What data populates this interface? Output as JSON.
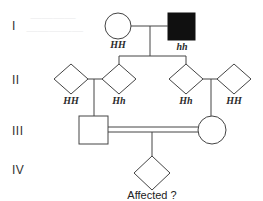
{
  "figure": {
    "type": "pedigree-chart",
    "caption": "Affected ?",
    "generations": [
      "I",
      "II",
      "III",
      "IV"
    ]
  },
  "colors": {
    "stroke": "#444444",
    "affected_fill": "#101010",
    "unaffected_fill": "#ffffff",
    "text": "#222222",
    "ghost": "#e8e8ea"
  },
  "legend": {
    "affected_meaning": "filled symbol = affected",
    "unaffected_meaning": "open symbol = unaffected",
    "diamond_meaning": "diamond = sex unspecified",
    "double_line_meaning": "double line = consanguineous mating"
  },
  "generation_I": {
    "label": "I",
    "individuals": [
      {
        "id": "I-1",
        "shape": "circle",
        "sex": "female",
        "affected": false,
        "genotype": "HH"
      },
      {
        "id": "I-2",
        "shape": "square",
        "sex": "male",
        "affected": true,
        "genotype": "hh"
      }
    ]
  },
  "generation_II": {
    "label": "II",
    "individuals": [
      {
        "id": "II-1",
        "shape": "diamond",
        "sex": "unspecified",
        "affected": false,
        "genotype": "HH",
        "role": "spouse"
      },
      {
        "id": "II-2",
        "shape": "diamond",
        "sex": "unspecified",
        "affected": false,
        "genotype": "Hh",
        "role": "child"
      },
      {
        "id": "II-3",
        "shape": "diamond",
        "sex": "unspecified",
        "affected": false,
        "genotype": "Hh",
        "role": "child"
      },
      {
        "id": "II-4",
        "shape": "diamond",
        "sex": "unspecified",
        "affected": false,
        "genotype": "HH",
        "role": "spouse"
      }
    ]
  },
  "generation_III": {
    "label": "III",
    "consanguineous": true,
    "individuals": [
      {
        "id": "III-1",
        "shape": "square",
        "sex": "male",
        "affected": false,
        "genotype": ""
      },
      {
        "id": "III-2",
        "shape": "circle",
        "sex": "female",
        "affected": false,
        "genotype": ""
      }
    ]
  },
  "generation_IV": {
    "label": "IV",
    "individuals": [
      {
        "id": "IV-1",
        "shape": "diamond",
        "sex": "unspecified",
        "affected": null,
        "genotype": "",
        "caption": "Affected ?"
      }
    ]
  },
  "ghost_text": {
    "line1": "————",
    "line2": "—————"
  }
}
